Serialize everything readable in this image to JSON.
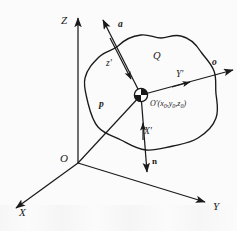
{
  "figure": {
    "type": "3d-coordinate-diagram",
    "background_color": "#fbfbfb",
    "stroke_color": "#1a1a1a"
  },
  "global_axes": {
    "origin_label": "O",
    "z_label": "Z",
    "x_label": "X",
    "y_label": "Y"
  },
  "local_axes": {
    "origin_label": "O'",
    "origin_coordinates": "(x0,y0,z0)",
    "coord_x": "x",
    "coord_y": "y",
    "coord_z": "z",
    "coord_sub": "0",
    "x_prime_label": "X'",
    "y_prime_label": "Y'",
    "z_prime_label": "z'"
  },
  "vectors": {
    "a_label": "a",
    "o_label": "o",
    "n_label": "n",
    "p_label": "p"
  },
  "regions": {
    "surface_label": "Q"
  }
}
